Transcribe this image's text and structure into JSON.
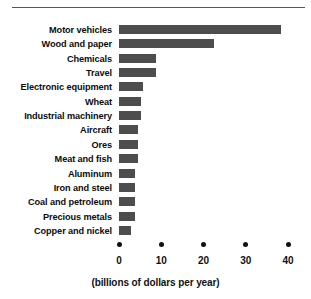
{
  "chart_data": {
    "type": "bar",
    "orientation": "horizontal",
    "title": "",
    "xlabel": "(billions of dollars per year)",
    "ylabel": "",
    "xlim": [
      0,
      40
    ],
    "xticks": [
      0,
      10,
      20,
      30,
      40
    ],
    "xtick_labels": [
      "0",
      "10",
      "20",
      "30",
      "40"
    ],
    "grid": false,
    "legend": false,
    "bar_color": "#4d4d4d",
    "categories": [
      "Motor vehicles",
      "Wood and paper",
      "Chemicals",
      "Travel",
      "Electronic equipment",
      "Wheat",
      "Industrial machinery",
      "Aircraft",
      "Ores",
      "Meat and fish",
      "Aluminum",
      "Iron and steel",
      "Coal and petroleum",
      "Precious metals",
      "Copper and nickel"
    ],
    "values": [
      38.4,
      22.4,
      8.7,
      8.7,
      5.6,
      5.2,
      5.2,
      4.4,
      4.4,
      4.4,
      3.8,
      3.7,
      3.7,
      3.7,
      2.8
    ]
  },
  "caption": "(billions of dollars per year)"
}
